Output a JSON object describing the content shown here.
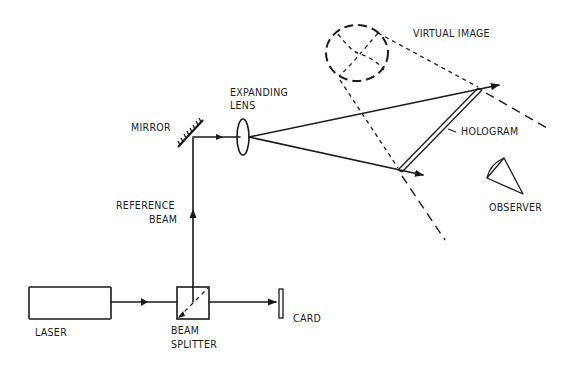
{
  "diagram": {
    "type": "optical holography setup (reconstruction / viewing)",
    "labels": {
      "virtual_image": "VIRTUAL IMAGE",
      "expanding_lens_line1": "EXPANDING",
      "expanding_lens_line2": "LENS",
      "mirror": "MIRROR",
      "hologram": "HOLOGRAM",
      "observer": "OBSERVER",
      "reference_beam_line1": "REFERENCE",
      "reference_beam_line2": "BEAM",
      "laser": "LASER",
      "beam_splitter_line1": "BEAM",
      "beam_splitter_line2": "SPLITTER",
      "card": "CARD"
    },
    "components": [
      {
        "id": "laser",
        "label": "LASER"
      },
      {
        "id": "beam-splitter",
        "label": "BEAM SPLITTER"
      },
      {
        "id": "card",
        "label": "CARD"
      },
      {
        "id": "mirror",
        "label": "MIRROR"
      },
      {
        "id": "expanding-lens",
        "label": "EXPANDING LENS"
      },
      {
        "id": "hologram",
        "label": "HOLOGRAM"
      },
      {
        "id": "observer",
        "label": "OBSERVER"
      },
      {
        "id": "virtual-image",
        "label": "VIRTUAL IMAGE"
      }
    ],
    "connections": [
      {
        "from": "laser",
        "to": "beam-splitter"
      },
      {
        "from": "beam-splitter",
        "to": "card"
      },
      {
        "from": "beam-splitter",
        "to": "mirror",
        "label": "REFERENCE BEAM"
      },
      {
        "from": "mirror",
        "to": "expanding-lens"
      },
      {
        "from": "expanding-lens",
        "to": "hologram"
      }
    ],
    "colors": {
      "ink": "#1a1a1a",
      "background": "#ffffff"
    }
  }
}
